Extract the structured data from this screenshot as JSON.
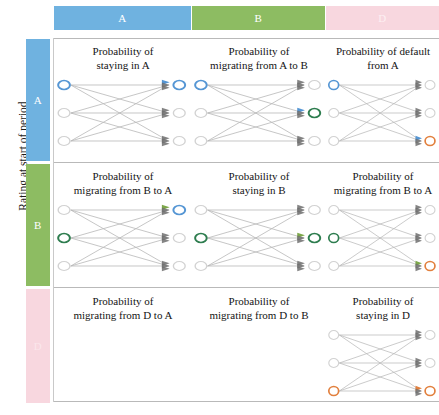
{
  "figure": {
    "y_axis_label": "Rating at start of period",
    "x_axis_label": "",
    "colors": {
      "rating_a": "#6FB2E0",
      "rating_b": "#8DBC62",
      "rating_d": "#F8D7DF",
      "node_a_stroke": "#5596D4",
      "node_b_stroke": "#2E7D4F",
      "node_d_stroke": "#E2803E",
      "node_inactive_stroke": "#d2d2d2",
      "edge": "#b9b9b9",
      "arrow": "#6e6e6e",
      "rule": "#b9b9b9"
    }
  },
  "columns": [
    {
      "label": "A",
      "color": "#6FB2E0"
    },
    {
      "label": "B",
      "color": "#8DBC62"
    },
    {
      "label": "D",
      "color": "#F8D7DF"
    }
  ],
  "rows": [
    {
      "label": "A",
      "color": "#6FB2E0"
    },
    {
      "label": "B",
      "color": "#8DBC62"
    },
    {
      "label": "D",
      "color": "#F8D7DF"
    }
  ],
  "cells": [
    {
      "row": "A",
      "col": "A",
      "title_line1": "Probability of",
      "title_line2": "staying in A",
      "has_diagram": true,
      "left_highlight": 0,
      "left_highlight_color": "#5596D4",
      "right_highlight": 0,
      "right_highlight_color": "#5596D4",
      "arrow_accent_index": 0,
      "arrow_accent_color": "#5596D4"
    },
    {
      "row": "A",
      "col": "B",
      "title_line1": "Probability of",
      "title_line2": "migrating from A to B",
      "has_diagram": true,
      "left_highlight": 0,
      "left_highlight_color": "#5596D4",
      "right_highlight": 1,
      "right_highlight_color": "#2E7D4F",
      "arrow_accent_index": 1,
      "arrow_accent_color": "#5596D4"
    },
    {
      "row": "A",
      "col": "D",
      "title_line1": "Probability of default",
      "title_line2": "from A",
      "has_diagram": true,
      "left_highlight": 0,
      "left_highlight_color": "#5596D4",
      "right_highlight": 2,
      "right_highlight_color": "#E2803E",
      "arrow_accent_index": 2,
      "arrow_accent_color": "#5596D4"
    },
    {
      "row": "B",
      "col": "A",
      "title_line1": "Probability of",
      "title_line2": "migrating from B to A",
      "has_diagram": true,
      "left_highlight": 1,
      "left_highlight_color": "#2E7D4F",
      "right_highlight": 0,
      "right_highlight_color": "#5596D4",
      "arrow_accent_index": 0,
      "arrow_accent_color": "#7DA84A"
    },
    {
      "row": "B",
      "col": "B",
      "title_line1": "Probability of",
      "title_line2": "staying in B",
      "has_diagram": true,
      "left_highlight": 1,
      "left_highlight_color": "#2E7D4F",
      "right_highlight": 1,
      "right_highlight_color": "#2E7D4F",
      "arrow_accent_index": 1,
      "arrow_accent_color": "#7DA84A"
    },
    {
      "row": "B",
      "col": "D",
      "title_line1": "Probability of",
      "title_line2": "migrating from B to A",
      "has_diagram": true,
      "left_highlight": 1,
      "left_highlight_color": "#2E7D4F",
      "right_highlight": 2,
      "right_highlight_color": "#E2803E",
      "arrow_accent_index": 2,
      "arrow_accent_color": "#7DA84A"
    },
    {
      "row": "D",
      "col": "A",
      "title_line1": "Probability of",
      "title_line2": "migrating from D to A",
      "has_diagram": false,
      "left_highlight": -1,
      "left_highlight_color": "",
      "right_highlight": -1,
      "right_highlight_color": "",
      "arrow_accent_index": -1,
      "arrow_accent_color": ""
    },
    {
      "row": "D",
      "col": "B",
      "title_line1": "Probability of",
      "title_line2": "migrating from D to B",
      "has_diagram": false,
      "left_highlight": -1,
      "left_highlight_color": "",
      "right_highlight": -1,
      "right_highlight_color": "",
      "arrow_accent_index": -1,
      "arrow_accent_color": ""
    },
    {
      "row": "D",
      "col": "D",
      "title_line1": "Probability of",
      "title_line2": "staying in D",
      "has_diagram": true,
      "left_highlight": 2,
      "left_highlight_color": "#E2803E",
      "right_highlight": 2,
      "right_highlight_color": "#E2803E",
      "arrow_accent_index": 2,
      "arrow_accent_color": "#E2803E"
    }
  ]
}
